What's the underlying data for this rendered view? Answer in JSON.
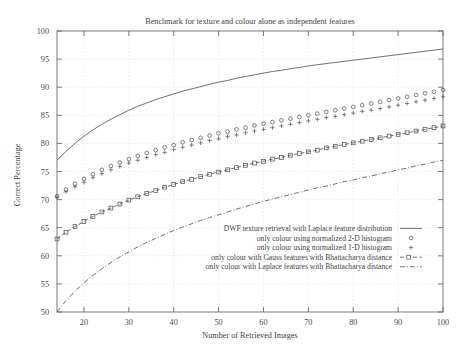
{
  "chart_data": {
    "type": "line",
    "title": "Benchmark for texture and colour alone as independent features",
    "xlabel": "Number of Retrieved Images",
    "ylabel": "Correct Percentage",
    "xlim": [
      14,
      100
    ],
    "ylim": [
      50,
      100
    ],
    "xticks": [
      20,
      30,
      40,
      50,
      60,
      70,
      80,
      90,
      100
    ],
    "yticks": [
      50,
      55,
      60,
      65,
      70,
      75,
      80,
      85,
      90,
      95,
      100
    ],
    "grid": true,
    "legend_position": "bottom-right",
    "x": [
      14,
      16,
      18,
      20,
      22,
      24,
      26,
      28,
      30,
      32,
      34,
      36,
      38,
      40,
      42,
      44,
      46,
      48,
      50,
      52,
      54,
      56,
      58,
      60,
      62,
      64,
      66,
      68,
      70,
      72,
      74,
      76,
      78,
      80,
      82,
      84,
      86,
      88,
      90,
      92,
      94,
      96,
      98,
      100
    ],
    "series": [
      {
        "name": "DWF texture retrieval with Laplace feature distribution",
        "marker": "none",
        "linestyle": "solid",
        "color": "#555555",
        "values": [
          77.0,
          78.6,
          80.0,
          81.3,
          82.4,
          83.4,
          84.3,
          85.1,
          85.9,
          86.6,
          87.2,
          87.8,
          88.3,
          88.8,
          89.3,
          89.7,
          90.1,
          90.5,
          90.9,
          91.2,
          91.6,
          91.9,
          92.2,
          92.5,
          92.8,
          93.0,
          93.3,
          93.5,
          93.8,
          94.0,
          94.2,
          94.4,
          94.6,
          94.8,
          95.0,
          95.2,
          95.4,
          95.6,
          95.8,
          96.0,
          96.2,
          96.4,
          96.6,
          96.8
        ]
      },
      {
        "name": "only colour using normalized 2-D histogram",
        "marker": "circle",
        "linestyle": "none",
        "color": "#555555",
        "values": [
          70.6,
          71.8,
          72.8,
          73.7,
          74.5,
          75.3,
          76.0,
          76.6,
          77.2,
          77.8,
          78.3,
          78.8,
          79.3,
          79.7,
          80.2,
          80.6,
          81.0,
          81.4,
          81.8,
          82.1,
          82.5,
          82.8,
          83.2,
          83.5,
          83.8,
          84.1,
          84.4,
          84.7,
          85.0,
          85.3,
          85.6,
          85.9,
          86.2,
          86.5,
          86.8,
          87.1,
          87.4,
          87.7,
          88.0,
          88.3,
          88.6,
          88.9,
          89.2,
          89.5
        ]
      },
      {
        "name": "only colour using normalized 1-D histogram",
        "marker": "plus",
        "linestyle": "none",
        "color": "#555555",
        "values": [
          70.4,
          71.4,
          72.3,
          73.1,
          73.9,
          74.6,
          75.3,
          75.9,
          76.5,
          77.0,
          77.5,
          78.0,
          78.4,
          78.9,
          79.3,
          79.7,
          80.1,
          80.5,
          80.8,
          81.2,
          81.5,
          81.9,
          82.2,
          82.5,
          82.8,
          83.1,
          83.4,
          83.7,
          84.0,
          84.3,
          84.6,
          84.8,
          85.1,
          85.4,
          85.7,
          85.9,
          86.2,
          86.5,
          86.8,
          87.1,
          87.4,
          87.7,
          88.0,
          88.3
        ]
      },
      {
        "name": "only colour with Gauss features with Bhattacharya distance",
        "marker": "square",
        "linestyle": "dashed",
        "color": "#555555",
        "values": [
          63.0,
          64.2,
          65.2,
          66.1,
          67.0,
          67.8,
          68.5,
          69.2,
          69.9,
          70.5,
          71.1,
          71.6,
          72.2,
          72.7,
          73.2,
          73.6,
          74.1,
          74.5,
          74.9,
          75.3,
          75.7,
          76.1,
          76.5,
          76.8,
          77.2,
          77.5,
          77.9,
          78.2,
          78.5,
          78.8,
          79.2,
          79.5,
          79.8,
          80.1,
          80.4,
          80.7,
          81.0,
          81.3,
          81.6,
          81.9,
          82.2,
          82.5,
          82.8,
          83.1
        ]
      },
      {
        "name": "only colour with Laplace features with Bhattacharya distance",
        "marker": "none",
        "linestyle": "dashdot",
        "color": "#555555",
        "values": [
          50.0,
          52.0,
          53.7,
          55.2,
          56.5,
          57.7,
          58.8,
          59.8,
          60.7,
          61.6,
          62.4,
          63.1,
          63.8,
          64.5,
          65.1,
          65.7,
          66.3,
          66.8,
          67.3,
          67.8,
          68.3,
          68.8,
          69.2,
          69.7,
          70.1,
          70.5,
          70.9,
          71.3,
          71.7,
          72.1,
          72.4,
          72.8,
          73.2,
          73.5,
          73.9,
          74.2,
          74.6,
          74.9,
          75.3,
          75.6,
          76.0,
          76.3,
          76.7,
          77.0
        ]
      }
    ]
  },
  "legend": {
    "items": [
      {
        "label": "DWF texture retrieval with Laplace feature distribution",
        "glyph": "line-solid"
      },
      {
        "label": "only colour using normalized 2-D histogram",
        "glyph": "circle-marker"
      },
      {
        "label": "only colour using normalized 1-D histogram",
        "glyph": "plus-marker"
      },
      {
        "label": "only colour with Gauss features with Bhattacharya distance",
        "glyph": "square-dashed"
      },
      {
        "label": "only colour with Laplace features with Bhattacharya distance",
        "glyph": "line-dashdot"
      }
    ]
  },
  "colors": {
    "background": "#ffffff",
    "axis": "#6b6b6b",
    "grid": "#d8d8d8",
    "ink": "#3f3f3f"
  }
}
